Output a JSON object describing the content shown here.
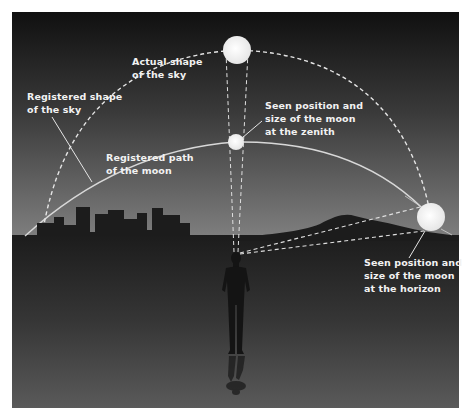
{
  "diagram": {
    "colors": {
      "sky_top": "#121212",
      "sky_horizon": "#7a7a7a",
      "ground_top": "#1e1e1e",
      "ground_bottom": "#575757",
      "silhouette": "#1c1c1c",
      "moon": "#f0f0f0",
      "line": "#e6e6e6"
    },
    "labels": {
      "actual_sky": {
        "line1": "Actual shape",
        "line2": "of the sky"
      },
      "registered_sky": {
        "line1": "Registered shape",
        "line2": "of the sky"
      },
      "registered_path": {
        "line1": "Registered path",
        "line2": "of the moon"
      },
      "zenith_moon": {
        "line1": "Seen position and",
        "line2": "size of the moon",
        "line3": "at the zenith"
      },
      "horizon_moon": {
        "line1": "Seen position and",
        "line2": "size of the moon",
        "line3": "at the horizon"
      }
    },
    "elements": {
      "actual_moon": "large moon at top of actual sky dome",
      "zenith_moon": "small moon on registered path at zenith",
      "horizon_moon": "large moon at horizon",
      "observer": "standing person silhouette with reflection",
      "city": "city skyline silhouette",
      "hills": "hill silhouette on right horizon"
    }
  }
}
